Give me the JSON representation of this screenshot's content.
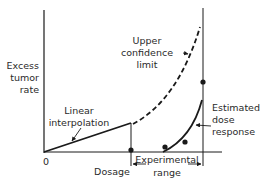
{
  "diagram": {
    "type": "dose-response",
    "y_axis_label": [
      "Excess",
      "tumor",
      "rate"
    ],
    "x_axis_label": "Dosage",
    "origin_label": "0",
    "annotations": {
      "upper_confidence_limit": [
        "Upper",
        "confidence",
        "limit"
      ],
      "linear_interpolation": [
        "Linear",
        "interpolation"
      ],
      "estimated_dose_response": [
        "Estimated",
        "dose",
        "response"
      ],
      "experimental_range": [
        "Experimental",
        "range"
      ]
    },
    "colors": {
      "line": "#1a1a1a",
      "text": "#2a2a2a",
      "background": "#ffffff"
    }
  }
}
